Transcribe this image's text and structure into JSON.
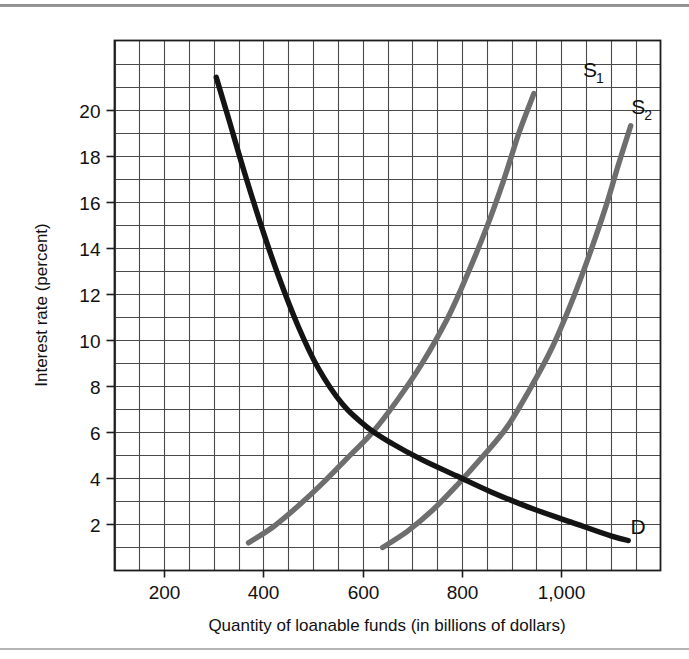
{
  "figure": {
    "background_color": "#ffffff",
    "rule_color": "#8d8d8d"
  },
  "chart_data": {
    "type": "line",
    "title": "",
    "xlabel": "Quantity of loanable funds (in billions of dollars)",
    "ylabel": "Interest rate (percent)",
    "xlim": [
      100,
      1200
    ],
    "ylim": [
      0,
      23
    ],
    "grid": true,
    "grid_step_x": 50,
    "grid_step_y": 1,
    "xticks": [
      200,
      400,
      600,
      800,
      1000
    ],
    "xtick_labels": [
      "200",
      "400",
      "600",
      "800",
      "1,000"
    ],
    "yticks": [
      2,
      4,
      6,
      8,
      10,
      12,
      14,
      16,
      18,
      20
    ],
    "ytick_labels": [
      "2",
      "4",
      "6",
      "8",
      "10",
      "12",
      "14",
      "16",
      "18",
      "20"
    ],
    "legend_position": "inline-curve-ends",
    "series": [
      {
        "name": "D",
        "label": "D",
        "label_sub": "",
        "role": "demand",
        "color": "#141414",
        "width": 5.4,
        "label_x": 1155,
        "label_y": 1.6,
        "points": [
          [
            305,
            21.4
          ],
          [
            330,
            19.6
          ],
          [
            360,
            17.4
          ],
          [
            395,
            15.0
          ],
          [
            430,
            12.8
          ],
          [
            470,
            10.6
          ],
          [
            510,
            8.8
          ],
          [
            560,
            7.2
          ],
          [
            610,
            6.2
          ],
          [
            660,
            5.5
          ],
          [
            720,
            4.8
          ],
          [
            790,
            4.1
          ],
          [
            860,
            3.4
          ],
          [
            940,
            2.7
          ],
          [
            1020,
            2.1
          ],
          [
            1100,
            1.5
          ],
          [
            1135,
            1.3
          ]
        ]
      },
      {
        "name": "S1",
        "label": "S",
        "label_sub": "1",
        "role": "supply-original",
        "color": "#6e6e6e",
        "width": 5.4,
        "label_x": 1058,
        "label_y": 21.4,
        "points": [
          [
            370,
            1.2
          ],
          [
            420,
            1.9
          ],
          [
            470,
            2.8
          ],
          [
            520,
            3.8
          ],
          [
            570,
            4.9
          ],
          [
            620,
            6.0
          ],
          [
            670,
            7.4
          ],
          [
            720,
            9.0
          ],
          [
            770,
            10.9
          ],
          [
            810,
            12.8
          ],
          [
            850,
            14.9
          ],
          [
            885,
            17.0
          ],
          [
            915,
            19.0
          ],
          [
            945,
            20.7
          ]
        ]
      },
      {
        "name": "S2",
        "label": "S",
        "label_sub": "2",
        "role": "supply-shifted",
        "color": "#6e6e6e",
        "width": 5.4,
        "label_x": 1155,
        "label_y": 19.8,
        "points": [
          [
            640,
            1.0
          ],
          [
            690,
            1.7
          ],
          [
            740,
            2.6
          ],
          [
            790,
            3.7
          ],
          [
            840,
            4.9
          ],
          [
            890,
            6.2
          ],
          [
            935,
            7.8
          ],
          [
            980,
            9.6
          ],
          [
            1020,
            11.6
          ],
          [
            1055,
            13.6
          ],
          [
            1090,
            15.8
          ],
          [
            1115,
            17.6
          ],
          [
            1140,
            19.3
          ]
        ]
      }
    ],
    "equilibria": [
      {
        "label": "S1 x D",
        "x": 650,
        "y": 6.0
      },
      {
        "label": "S2 x D",
        "x": 800,
        "y": 4.0
      }
    ]
  }
}
